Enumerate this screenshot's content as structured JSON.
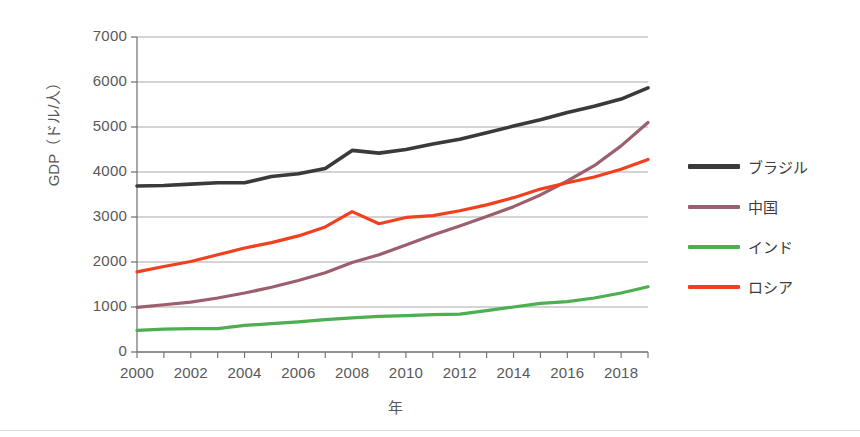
{
  "chart_data": {
    "type": "line",
    "title": "",
    "xlabel": "年",
    "ylabel": "GDP（ドル/人）",
    "xlim": [
      2000,
      2019
    ],
    "ylim": [
      0,
      7000
    ],
    "grid": true,
    "legend_position": "right",
    "y_ticks": [
      "0",
      "1000",
      "2000",
      "3000",
      "4000",
      "5000",
      "6000",
      "7000"
    ],
    "x_ticks": [
      "2000",
      "2002",
      "2004",
      "2006",
      "2008",
      "2010",
      "2012",
      "2014",
      "2016",
      "2018"
    ],
    "x": [
      2000,
      2001,
      2002,
      2003,
      2004,
      2005,
      2006,
      2007,
      2008,
      2009,
      2010,
      2011,
      2012,
      2013,
      2014,
      2015,
      2016,
      2017,
      2018,
      2019
    ],
    "series": [
      {
        "name": "ブラジル",
        "color": "#3a3a38",
        "values": [
          3690,
          3700,
          3730,
          3760,
          3760,
          3900,
          3960,
          4080,
          4480,
          4420,
          4500,
          4620,
          4730,
          4870,
          5020,
          5160,
          5320,
          5460,
          5620,
          5870
        ]
      },
      {
        "name": "中国",
        "color": "#9c5f6e",
        "values": [
          990,
          1050,
          1110,
          1200,
          1310,
          1440,
          1590,
          1760,
          1990,
          2160,
          2380,
          2600,
          2800,
          3010,
          3230,
          3490,
          3800,
          4140,
          4580,
          5100
        ]
      },
      {
        "name": "インド",
        "color": "#4caf50",
        "values": [
          480,
          510,
          520,
          520,
          590,
          630,
          670,
          720,
          760,
          790,
          810,
          830,
          840,
          920,
          1000,
          1080,
          1120,
          1200,
          1310,
          1450
        ]
      },
      {
        "name": "ロシア",
        "color": "#f2401f",
        "values": [
          1780,
          1900,
          2010,
          2160,
          2310,
          2430,
          2580,
          2780,
          3120,
          2850,
          2990,
          3030,
          3140,
          3270,
          3430,
          3620,
          3760,
          3890,
          4060,
          4280
        ]
      }
    ]
  },
  "axes": {
    "y_label": "GDP（ドル/人）",
    "x_label": "年"
  },
  "legend": {
    "items": [
      {
        "label": "ブラジル",
        "color": "#3a3a38"
      },
      {
        "label": "中国",
        "color": "#9c5f6e"
      },
      {
        "label": "インド",
        "color": "#4caf50"
      },
      {
        "label": "ロシア",
        "color": "#f2401f"
      }
    ]
  }
}
